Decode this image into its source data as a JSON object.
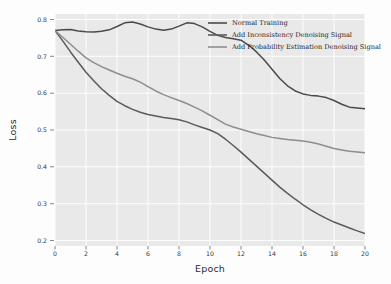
{
  "figure": {
    "background_color": "#fdfdfd",
    "panel_color": "#e9e9e9",
    "grid_color": "#ffffff"
  },
  "chart_data": {
    "type": "line",
    "title": "",
    "xlabel": "Epoch",
    "ylabel": "Loss",
    "xlim": [
      0,
      20
    ],
    "ylim": [
      0.185,
      0.815
    ],
    "xticks": [
      0,
      2,
      4,
      6,
      8,
      10,
      12,
      14,
      16,
      18,
      20
    ],
    "xtick_labels": [
      "0",
      "2",
      "4",
      "6",
      "8",
      "10",
      "12",
      "14",
      "16",
      "18",
      "20"
    ],
    "yticks": [
      0.2,
      0.3,
      0.4,
      0.5,
      0.6,
      0.7,
      0.8
    ],
    "ytick_labels": [
      "0.2",
      "0.3",
      "0.4",
      "0.5",
      "0.6",
      "0.7",
      "0.8"
    ],
    "grid": true,
    "legend_position": "upper right",
    "x": [
      0,
      0.5,
      1,
      1.5,
      2,
      2.5,
      3,
      3.5,
      4,
      4.5,
      5,
      5.5,
      6,
      6.5,
      7,
      7.5,
      8,
      8.5,
      9,
      9.5,
      10,
      10.5,
      11,
      11.5,
      12,
      12.5,
      13,
      13.5,
      14,
      14.5,
      15,
      15.5,
      16,
      16.5,
      17,
      17.5,
      18,
      18.5,
      19,
      19.5,
      20
    ],
    "series": [
      {
        "name": "Normal Training",
        "color": "#4a4a4a",
        "values": [
          0.77,
          0.772,
          0.773,
          0.769,
          0.767,
          0.766,
          0.768,
          0.772,
          0.781,
          0.791,
          0.793,
          0.788,
          0.78,
          0.774,
          0.771,
          0.774,
          0.782,
          0.791,
          0.789,
          0.78,
          0.768,
          0.757,
          0.751,
          0.748,
          0.744,
          0.73,
          0.712,
          0.69,
          0.665,
          0.64,
          0.62,
          0.606,
          0.598,
          0.594,
          0.592,
          0.588,
          0.58,
          0.57,
          0.562,
          0.56,
          0.558
        ]
      },
      {
        "name": "Add Inconsistency Denoising Signal",
        "color": "#5a5a5a",
        "values": [
          0.77,
          0.742,
          0.712,
          0.684,
          0.657,
          0.634,
          0.612,
          0.594,
          0.578,
          0.566,
          0.556,
          0.548,
          0.542,
          0.538,
          0.534,
          0.531,
          0.528,
          0.522,
          0.514,
          0.507,
          0.5,
          0.49,
          0.475,
          0.458,
          0.44,
          0.421,
          0.402,
          0.383,
          0.364,
          0.345,
          0.328,
          0.312,
          0.297,
          0.283,
          0.271,
          0.26,
          0.25,
          0.242,
          0.234,
          0.226,
          0.219
        ]
      },
      {
        "name": "Add Probability Estimation Denoising Signal",
        "color": "#8d8d8d",
        "values": [
          0.77,
          0.752,
          0.733,
          0.714,
          0.696,
          0.683,
          0.672,
          0.663,
          0.654,
          0.646,
          0.639,
          0.63,
          0.618,
          0.606,
          0.596,
          0.588,
          0.58,
          0.572,
          0.562,
          0.552,
          0.54,
          0.528,
          0.516,
          0.508,
          0.502,
          0.496,
          0.49,
          0.485,
          0.48,
          0.477,
          0.474,
          0.472,
          0.47,
          0.467,
          0.462,
          0.456,
          0.45,
          0.446,
          0.442,
          0.44,
          0.438
        ]
      }
    ]
  },
  "legend": {
    "entries": [
      {
        "label": "Normal Training"
      },
      {
        "label": "Add Inconsistency Denoising Signal"
      },
      {
        "label": "Add Probability Estimation Denoising Signal"
      }
    ]
  }
}
